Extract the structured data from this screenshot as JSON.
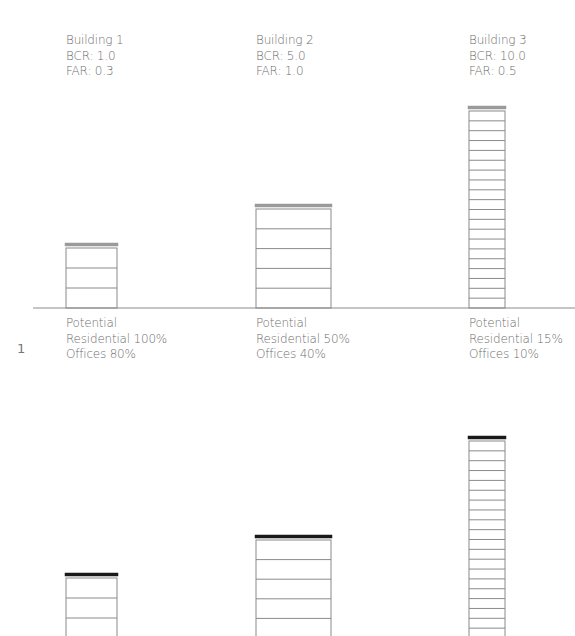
{
  "figure_number": "1",
  "colors": {
    "line": "#8a8a8a",
    "roof_top_section": "#9a9a9a",
    "roof_bottom_section": "#1a1a1a",
    "text": "#6e6e6e"
  },
  "buildings": [
    {
      "name": "Building 1",
      "bcr": "BCR: 1.0",
      "far": "FAR: 0.3",
      "potential_title": "Potential",
      "residential": "Residential 100%",
      "offices": "Offices 80%",
      "floors": 3,
      "x": 66,
      "width": 51,
      "top_roof_y": 243,
      "bottom_roof_y": 573,
      "header_x": 66,
      "potential_x": 66
    },
    {
      "name": "Building 2",
      "bcr": "BCR: 5.0",
      "far": "FAR: 1.0",
      "potential_title": "Potential",
      "residential": "Residential 50%",
      "offices": "Offices 40%",
      "floors": 5,
      "x": 256,
      "width": 75,
      "top_roof_y": 204,
      "bottom_roof_y": 535,
      "header_x": 256,
      "potential_x": 256
    },
    {
      "name": "Building 3",
      "bcr": "BCR: 10.0",
      "far": "FAR: 0.5",
      "potential_title": "Potential",
      "residential": "Residential 15%",
      "offices": "Offices 10%",
      "floors": 20,
      "x": 469,
      "width": 36,
      "top_roof_y": 106,
      "bottom_roof_y": 436,
      "header_x": 469,
      "potential_x": 469
    }
  ],
  "layout": {
    "top_ground_y": 308,
    "bottom_ground_y": 638,
    "ground_x1": 33,
    "ground_x2": 575
  }
}
